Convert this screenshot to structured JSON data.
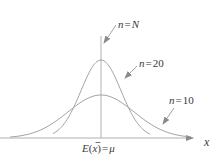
{
  "figure": {
    "type": "sampling-distribution-diagram",
    "axis_label_x": "x",
    "center_label": {
      "E": "E",
      "open": "(",
      "var": "x",
      "close": ")",
      "eq": "=",
      "mu": "μ",
      "full": "E(x̄)=μ"
    },
    "curves": [
      {
        "id": "n10",
        "label_n": "n",
        "label_eq": "=",
        "label_val": "10",
        "relative_spread": 2.0,
        "relative_peak": 0.5
      },
      {
        "id": "n20",
        "label_n": "n",
        "label_eq": "=",
        "label_val": "20",
        "relative_spread": 1.0,
        "relative_peak": 1.0
      },
      {
        "id": "nN",
        "label_n": "n",
        "label_eq": "=",
        "label_val": "N",
        "relative_spread": 0.0,
        "relative_peak": null
      }
    ],
    "colors": {
      "curve": "#9a9a9a",
      "axis": "#a0a0a0",
      "text": "#3a3a3a",
      "arrow": "#8a8a8a"
    }
  }
}
